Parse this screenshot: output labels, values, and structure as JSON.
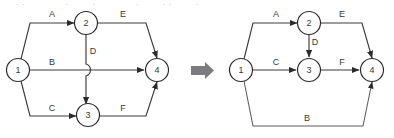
{
  "page": {
    "top_cropped_text": "—  ··  —  —  ·  —  ·  —  —  ·  —  ··  —  ·  —",
    "background": "#ffffff",
    "ink": "#3c3c3c"
  },
  "transform_arrow": {
    "name": "transform-arrow",
    "glyph": "⇒",
    "color": "#7b7b80"
  },
  "diagrams": [
    {
      "id": "before",
      "name": "activity-network-before",
      "nodes": [
        {
          "id": "n1",
          "label": "1",
          "cx": 18,
          "cy": 70
        },
        {
          "id": "n2",
          "label": "2",
          "cx": 86,
          "cy": 23
        },
        {
          "id": "n3",
          "label": "3",
          "cx": 88,
          "cy": 115
        },
        {
          "id": "n4",
          "label": "4",
          "cx": 157,
          "cy": 70
        }
      ],
      "edges": [
        {
          "id": "A",
          "label": "A",
          "from": "1",
          "to": "2",
          "label_x": 52,
          "label_y": 14
        },
        {
          "id": "B",
          "label": "B",
          "from": "1",
          "to": "4",
          "label_x": 52,
          "label_y": 62
        },
        {
          "id": "C",
          "label": "C",
          "from": "1",
          "to": "3",
          "label_x": 52,
          "label_y": 108
        },
        {
          "id": "D",
          "label": "D",
          "from": "2",
          "to": "3",
          "label_x": 93,
          "label_y": 51
        },
        {
          "id": "E",
          "label": "E",
          "from": "2",
          "to": "4",
          "label_x": 123,
          "label_y": 14
        },
        {
          "id": "F",
          "label": "F",
          "from": "3",
          "to": "4",
          "label_x": 123,
          "label_y": 108
        }
      ]
    },
    {
      "id": "after",
      "name": "activity-network-after",
      "nodes": [
        {
          "id": "n1",
          "label": "1",
          "cx": 241,
          "cy": 70
        },
        {
          "id": "n2",
          "label": "2",
          "cx": 309,
          "cy": 23
        },
        {
          "id": "n3",
          "label": "3",
          "cx": 309,
          "cy": 70
        },
        {
          "id": "n4",
          "label": "4",
          "cx": 372,
          "cy": 70
        }
      ],
      "edges": [
        {
          "id": "A",
          "label": "A",
          "from": "1",
          "to": "2",
          "label_x": 276,
          "label_y": 14
        },
        {
          "id": "C",
          "label": "C",
          "from": "1",
          "to": "3",
          "label_x": 276,
          "label_y": 62
        },
        {
          "id": "D",
          "label": "D",
          "from": "2",
          "to": "3",
          "label_x": 315,
          "label_y": 42
        },
        {
          "id": "E",
          "label": "E",
          "from": "2",
          "to": "4",
          "label_x": 342,
          "label_y": 14
        },
        {
          "id": "F",
          "label": "F",
          "from": "3",
          "to": "4",
          "label_x": 342,
          "label_y": 62
        },
        {
          "id": "B",
          "label": "B",
          "from": "1",
          "to": "4",
          "label_x": 307,
          "label_y": 118
        }
      ]
    }
  ]
}
